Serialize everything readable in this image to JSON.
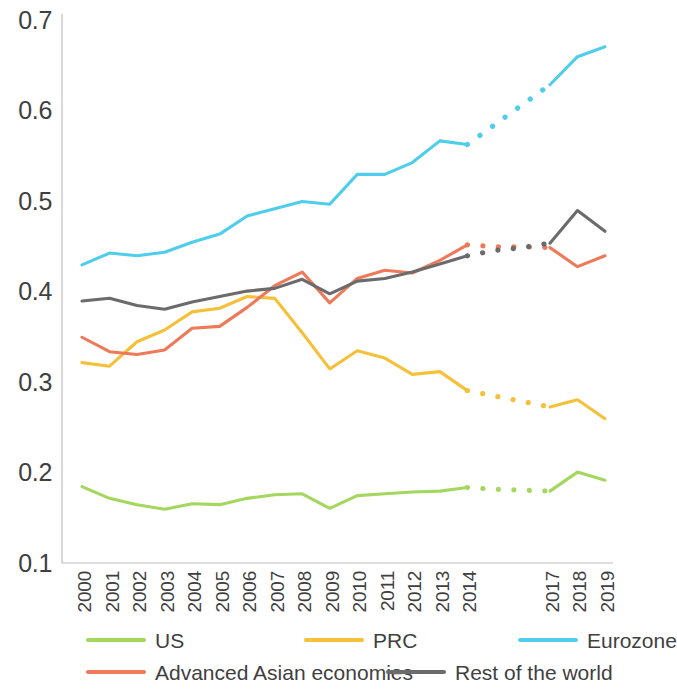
{
  "chart_data": {
    "type": "line",
    "title": "",
    "subtitle": "",
    "xlabel": "",
    "ylabel": "",
    "grid": false,
    "legend_position": "bottom",
    "x": [
      2000,
      2001,
      2002,
      2003,
      2004,
      2005,
      2006,
      2007,
      2008,
      2009,
      2010,
      2011,
      2012,
      2013,
      2014,
      2015,
      2016,
      2017,
      2018,
      2019
    ],
    "xtick_labels": [
      "2000",
      "2001",
      "2002",
      "2003",
      "2004",
      "2005",
      "2006",
      "2007",
      "2008",
      "2009",
      "2010",
      "2011",
      "2012",
      "2013",
      "2014",
      "",
      "",
      "2017",
      "2018",
      "2019"
    ],
    "ytick_labels": [
      "0.1",
      "0.2",
      "0.3",
      "0.4",
      "0.5",
      "0.6",
      "0.7"
    ],
    "ytick_values": [
      0.1,
      0.2,
      0.3,
      0.4,
      0.5,
      0.6,
      0.7
    ],
    "ylim": [
      0.1,
      0.7
    ],
    "xlim": [
      2000,
      2019
    ],
    "dashed_range": [
      2014,
      2017
    ],
    "dashed_note": "Segments between 2014 and 2017 are drawn as dotted interpolation",
    "series": [
      {
        "name": "US",
        "color": "#a5d75e",
        "values": [
          0.185,
          0.172,
          0.165,
          0.16,
          0.166,
          0.165,
          0.172,
          0.176,
          0.177,
          0.161,
          0.175,
          0.177,
          0.179,
          0.18,
          0.184,
          0.182,
          0.181,
          0.18,
          0.201,
          0.192
        ]
      },
      {
        "name": "PRC",
        "color": "#f5c03a",
        "values": [
          0.322,
          0.318,
          0.345,
          0.358,
          0.378,
          0.382,
          0.395,
          0.393,
          0.355,
          0.315,
          0.335,
          0.327,
          0.309,
          0.312,
          0.291,
          0.285,
          0.279,
          0.273,
          0.281,
          0.26
        ]
      },
      {
        "name": "Eurozone",
        "color": "#4fcdeb",
        "values": [
          0.43,
          0.443,
          0.44,
          0.444,
          0.455,
          0.464,
          0.484,
          0.492,
          0.5,
          0.497,
          0.53,
          0.53,
          0.543,
          0.567,
          0.563,
          0.585,
          0.607,
          0.629,
          0.66,
          0.671
        ]
      },
      {
        "name": "Advanced Asian economies",
        "color": "#ee7a5a",
        "values": [
          0.35,
          0.334,
          0.331,
          0.336,
          0.36,
          0.362,
          0.383,
          0.407,
          0.422,
          0.388,
          0.415,
          0.424,
          0.421,
          0.435,
          0.452,
          0.45,
          0.45,
          0.449,
          0.428,
          0.44
        ]
      },
      {
        "name": "Rest of the world",
        "color": "#6b6b6b",
        "values": [
          0.39,
          0.393,
          0.385,
          0.381,
          0.389,
          0.395,
          0.401,
          0.404,
          0.414,
          0.398,
          0.412,
          0.415,
          0.422,
          0.431,
          0.44,
          0.446,
          0.449,
          0.454,
          0.49,
          0.467
        ]
      }
    ]
  },
  "legend": {
    "rows": [
      [
        {
          "label": "US",
          "color": "#a5d75e"
        },
        {
          "label": "PRC",
          "color": "#f5c03a"
        },
        {
          "label": "Eurozone",
          "color": "#4fcdeb"
        }
      ],
      [
        {
          "label": "Advanced Asian economies",
          "color": "#ee7a5a"
        },
        {
          "label": "Rest of the world",
          "color": "#6b6b6b"
        }
      ]
    ]
  }
}
